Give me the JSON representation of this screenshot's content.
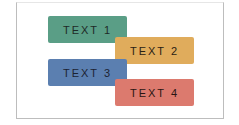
{
  "boxes": [
    {
      "label": "TEXT 1",
      "color": "#5a9e86"
    },
    {
      "label": "TEXT 2",
      "color": "#e0ac5c"
    },
    {
      "label": "TEXT 3",
      "color": "#5b7fb0"
    },
    {
      "label": "TEXT 4",
      "color": "#dc7a6e"
    }
  ]
}
